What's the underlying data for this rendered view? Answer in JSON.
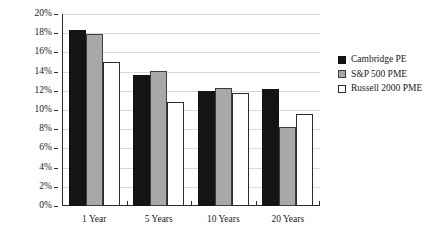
{
  "chart_data": {
    "type": "bar",
    "title": "",
    "xlabel": "",
    "ylabel": "",
    "ylim": [
      0,
      20
    ],
    "y_tick_step": 2,
    "y_tick_labels": [
      "20%",
      "18%",
      "16%",
      "14%",
      "12%",
      "10%",
      "8%",
      "6%",
      "4%",
      "2%",
      "0%"
    ],
    "y_tick_values": [
      20,
      18,
      16,
      14,
      12,
      10,
      8,
      6,
      4,
      2,
      0
    ],
    "grid": true,
    "grid_axis": "y",
    "legend_position": "right",
    "categories": [
      "1 Year",
      "5 Years",
      "10 Years",
      "20 Years"
    ],
    "series": [
      {
        "name": "Cambridge PE",
        "color": "#141414",
        "values": [
          18.3,
          13.6,
          12.0,
          12.2
        ]
      },
      {
        "name": "S&P 500 PME",
        "color": "#a8a8a8",
        "values": [
          17.9,
          14.1,
          12.3,
          8.2
        ]
      },
      {
        "name": "Russell 2000 PME",
        "color": "#ffffff",
        "values": [
          15.0,
          10.8,
          11.8,
          9.6
        ]
      }
    ]
  },
  "legend": {
    "items": [
      {
        "label": "Cambridge PE",
        "swatch": "legend-swatch-black"
      },
      {
        "label": "S&P 500 PME",
        "swatch": "legend-swatch-gray"
      },
      {
        "label": "Russell 2000 PME",
        "swatch": "legend-swatch-white"
      }
    ]
  }
}
